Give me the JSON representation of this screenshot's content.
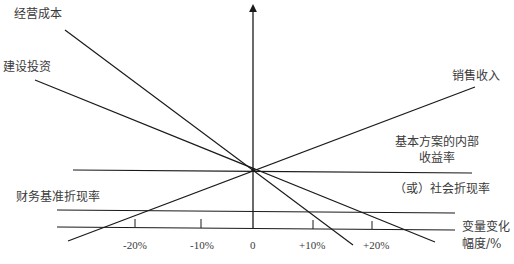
{
  "diagram": {
    "line_labels": {
      "operating_cost": "经营成本",
      "construction_investment": "建设投资",
      "sales_revenue": "销售收入"
    },
    "reference_labels": {
      "irr_line1": "基本方案的内部",
      "irr_line2": "收益率",
      "social_rate": "（或）社会折现率",
      "benchmark_rate": "财务基准折现率"
    },
    "x_axis": {
      "label_line1": "变量变化",
      "label_line2": "幅度/%",
      "ticks": [
        "-20%",
        "-10%",
        "0",
        "+10%",
        "+20%"
      ]
    },
    "colors": {
      "line": "#1a1a1a",
      "text": "#3a3a3a",
      "background": "#ffffff"
    }
  }
}
